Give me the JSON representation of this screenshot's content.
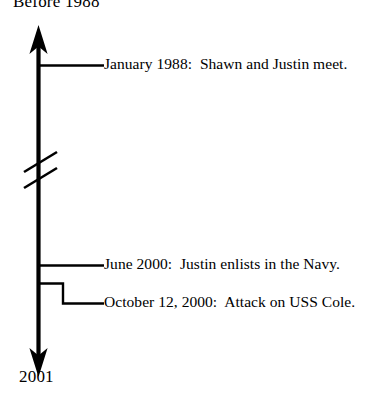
{
  "diagram": {
    "type": "vertical-timeline",
    "title_start": "Before 1988",
    "title_end": "2001",
    "colors": {
      "ink": "#000000",
      "background": "#ffffff"
    },
    "axis": {
      "orientation": "vertical",
      "has_start_arrow": true,
      "has_end_arrow": true,
      "has_break_marker": true,
      "break_marker_style": "double-slash"
    },
    "events": [
      {
        "date": "January 1988",
        "description": "Shawn and Justin meet.",
        "text": "January 1988:  Shawn and Justin meet.",
        "connector": "straight"
      },
      {
        "date": "June 2000",
        "description": "Justin enlists in the Navy.",
        "text": "June 2000:  Justin enlists in the Navy.",
        "connector": "straight"
      },
      {
        "date": "October 12, 2000",
        "description": "Attack on USS Cole.",
        "text": "October 12, 2000:  Attack on USS Cole.",
        "connector": "elbow"
      }
    ]
  }
}
